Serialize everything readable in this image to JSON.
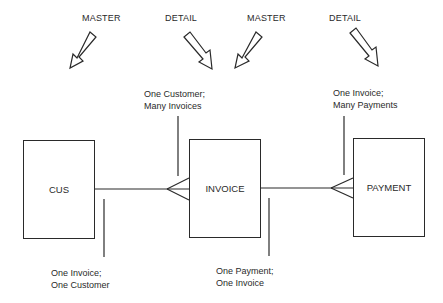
{
  "headers": [
    {
      "id": "master-1",
      "label": "MASTER"
    },
    {
      "id": "detail-1",
      "label": "DETAIL"
    },
    {
      "id": "master-2",
      "label": "MASTER"
    },
    {
      "id": "detail-2",
      "label": "DETAIL"
    }
  ],
  "entities": [
    {
      "id": "cus",
      "label": "CUS"
    },
    {
      "id": "invoice",
      "label": "INVOICE"
    },
    {
      "id": "payment",
      "label": "PAYMENT"
    }
  ],
  "annotations": {
    "cus_invoice_top": [
      "One Customer;",
      "Many Invoices"
    ],
    "invoice_payment_top": [
      "One Invoice;",
      "Many Payments"
    ],
    "cus_invoice_bottom": [
      "One Invoice;",
      "One Customer"
    ],
    "invoice_payment_bottom": [
      "One Payment;",
      "One Invoice"
    ]
  },
  "colors": {
    "stroke": "#2a2a2a",
    "background": "#ffffff"
  }
}
